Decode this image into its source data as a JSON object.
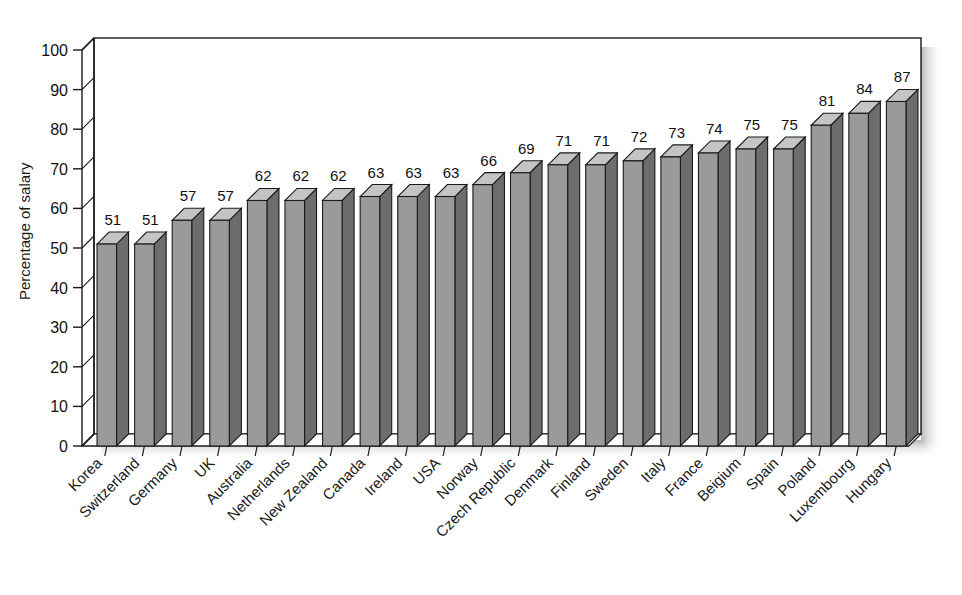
{
  "chart_data": {
    "type": "bar",
    "title": "",
    "subtitle": "",
    "xlabel": "",
    "ylabel": "Percentage of salary",
    "ylim": [
      0,
      100
    ],
    "ytick_step": 10,
    "yticks": [
      0,
      10,
      20,
      30,
      40,
      50,
      60,
      70,
      80,
      90,
      100
    ],
    "ytick_labels": [
      "0",
      "10",
      "20",
      "30",
      "40",
      "50",
      "60",
      "70",
      "80",
      "90",
      "100"
    ],
    "grid": false,
    "legend": null,
    "legend_position": "none",
    "data_labels": true,
    "style": "3d-column",
    "categories": [
      "Korea",
      "Switzerland",
      "Germany",
      "UK",
      "Australia",
      "Netherlands",
      "New Zealand",
      "Canada",
      "Ireland",
      "USA",
      "Norway",
      "Czech Republic",
      "Denmark",
      "Finland",
      "Sweden",
      "Italy",
      "France",
      "Beigium",
      "Spain",
      "Poland",
      "Luxembourg",
      "Hungary"
    ],
    "values": [
      51,
      51,
      57,
      57,
      62,
      62,
      62,
      63,
      63,
      63,
      66,
      69,
      71,
      71,
      72,
      73,
      74,
      75,
      75,
      81,
      84,
      87
    ],
    "series": [
      {
        "name": "Percentage of salary",
        "values": [
          51,
          51,
          57,
          57,
          62,
          62,
          62,
          63,
          63,
          63,
          66,
          69,
          71,
          71,
          72,
          73,
          74,
          75,
          75,
          81,
          84,
          87
        ]
      }
    ]
  },
  "colors": {
    "bar_front": "#9a9a9a",
    "bar_top": "#c4c4c4",
    "bar_side": "#6d6d6d",
    "outline": "#1a1a1a",
    "floor": "#f2f2f2",
    "wall": "#ffffff",
    "background": "#ffffff",
    "shadow": "#b8b8b8",
    "text": "#1a1a1a"
  },
  "axis": {
    "y_label": "Percentage of salary",
    "category_label_rotation": "-45"
  }
}
